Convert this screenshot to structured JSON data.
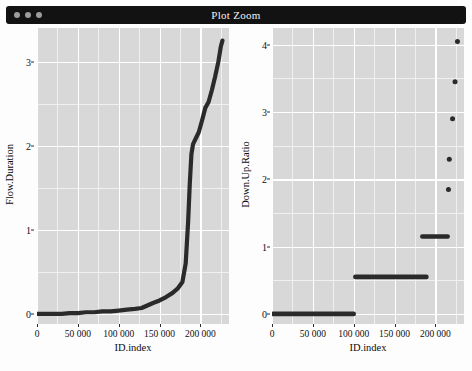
{
  "window": {
    "title": "Plot Zoom",
    "controls": [
      "close",
      "minimize",
      "maximize"
    ],
    "titlebar_color": "#121212",
    "title_color": "#f2f2f2"
  },
  "theme": {
    "panel_background": "#d8d8d8",
    "major_gridline": "#ffffff",
    "minor_gridline": "#f0f0f0",
    "series_color": "#2a2a2a",
    "page_background": "#fdfdfd"
  },
  "caption": "",
  "chart_data": [
    {
      "type": "line",
      "title": "",
      "xlabel": "ID.index",
      "ylabel": "Flow.Duration",
      "xlim": [
        0,
        235000
      ],
      "ylim": [
        -0.12,
        3.4
      ],
      "xticks": [
        0,
        50000,
        100000,
        150000,
        200000
      ],
      "xticklabels": [
        "0",
        "50 000",
        "100 000",
        "150 000",
        "200 000"
      ],
      "yticks": [
        0,
        1,
        2,
        3
      ],
      "yticklabels": [
        "0",
        "1",
        "2",
        "3"
      ],
      "grid": true,
      "legend": "none",
      "x": [
        0,
        10000,
        20000,
        30000,
        40000,
        50000,
        60000,
        70000,
        80000,
        90000,
        100000,
        110000,
        120000,
        128000,
        135000,
        142000,
        150000,
        158000,
        166000,
        172000,
        178000,
        182000,
        185000,
        187000,
        189000,
        191000,
        194000,
        198000,
        202000,
        206000,
        210000,
        214000,
        218000,
        222000,
        225000,
        227000
      ],
      "y": [
        0.0,
        0.0,
        0.0,
        0.0,
        0.01,
        0.01,
        0.02,
        0.02,
        0.03,
        0.03,
        0.04,
        0.05,
        0.06,
        0.07,
        0.1,
        0.13,
        0.16,
        0.2,
        0.25,
        0.3,
        0.38,
        0.6,
        1.1,
        1.55,
        1.9,
        2.02,
        2.08,
        2.16,
        2.3,
        2.45,
        2.52,
        2.66,
        2.82,
        3.0,
        3.18,
        3.25
      ]
    },
    {
      "type": "scatter",
      "title": "",
      "xlabel": "ID.index",
      "ylabel": "Down.Up.Ratio",
      "xlim": [
        0,
        235000
      ],
      "ylim": [
        -0.15,
        4.25
      ],
      "xticks": [
        0,
        50000,
        100000,
        150000,
        200000
      ],
      "xticklabels": [
        "0",
        "50 000",
        "100 000",
        "150 000",
        "200 000"
      ],
      "yticks": [
        0,
        1,
        2,
        3,
        4
      ],
      "yticklabels": [
        "0",
        "1",
        "2",
        "3",
        "4"
      ],
      "grid": true,
      "legend": "none",
      "segments": [
        {
          "y": 0.0,
          "x_start": 1000,
          "x_end": 100000
        },
        {
          "y": 0.55,
          "x_start": 102000,
          "x_end": 189000
        },
        {
          "y": 1.15,
          "x_start": 184000,
          "x_end": 215000
        }
      ],
      "points": [
        {
          "x": 216000,
          "y": 1.85
        },
        {
          "x": 217000,
          "y": 2.3
        },
        {
          "x": 221000,
          "y": 2.9
        },
        {
          "x": 224000,
          "y": 3.45
        },
        {
          "x": 227000,
          "y": 4.05
        }
      ]
    }
  ]
}
